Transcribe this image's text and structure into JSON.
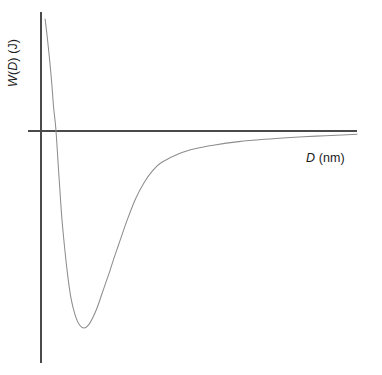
{
  "figure": {
    "background_color": "#ffffff",
    "width": 382,
    "height": 375
  },
  "axes": {
    "color": "#4a4a4a",
    "y_axis_label_full": "W(D) (J)",
    "x_axis_label_full": "D (nm)",
    "y_label_parts": {
      "symbol": "W",
      "arg_open": "(",
      "arg": "D",
      "arg_close": ")",
      "unit": " (J)"
    },
    "x_label_parts": {
      "symbol": "D",
      "unit": " (nm)"
    },
    "origin_px": {
      "x": 41,
      "y": 131
    },
    "y_axis_top_px": 12,
    "y_axis_bottom_px": 363,
    "x_axis_right_px": 357
  },
  "curve": {
    "color": "#8d8d8d",
    "stroke_width": 1.05,
    "description": "interaction free energy versus separation distance",
    "zero_crossing_px_x": 53,
    "minimum_px": {
      "x": 88,
      "y": 328
    }
  },
  "chart_data": {
    "type": "line",
    "title": "",
    "subtitle": "",
    "xlabel": "D (nm)",
    "ylabel": "W(D) (J)",
    "grid": false,
    "legend": false,
    "xlim": [
      0,
      1
    ],
    "ylim": [
      -1,
      1
    ],
    "axis_ticks": {
      "x": [],
      "y": []
    },
    "annotations": [],
    "series": [
      {
        "name": "W(D)",
        "comment": "Normalized coordinates: x in [0,1] across plot width, y in [-1,1] where 0 is the horizontal axis (zero energy line). Steep repulsive wall at small D, deep attractive minimum, asymptotic approach to zero at large D.",
        "x": [
          0.013,
          0.02,
          0.027,
          0.034,
          0.04,
          0.047,
          0.054,
          0.061,
          0.068,
          0.082,
          0.095,
          0.109,
          0.122,
          0.136,
          0.15,
          0.163,
          0.177,
          0.19,
          0.204,
          0.218,
          0.231,
          0.245,
          0.272,
          0.299,
          0.327,
          0.354,
          0.381,
          0.436,
          0.49,
          0.545,
          0.626,
          0.708,
          0.79,
          0.871,
          0.953,
          1.0
        ],
        "y": [
          0.96,
          0.8,
          0.62,
          0.41,
          0.2,
          0.02,
          -0.16,
          -0.33,
          -0.48,
          -0.7,
          -0.85,
          -0.94,
          -0.985,
          -1.0,
          -0.985,
          -0.95,
          -0.9,
          -0.84,
          -0.775,
          -0.71,
          -0.645,
          -0.58,
          -0.455,
          -0.345,
          -0.26,
          -0.2,
          -0.16,
          -0.115,
          -0.089,
          -0.072,
          -0.054,
          -0.042,
          -0.033,
          -0.026,
          -0.02,
          -0.017
        ]
      },
      {
        "name": "zero line (x-axis)",
        "comment": "horizontal axis representing W = 0",
        "x": [
          0.0,
          1.0
        ],
        "y": [
          0.0,
          0.0
        ]
      }
    ]
  }
}
